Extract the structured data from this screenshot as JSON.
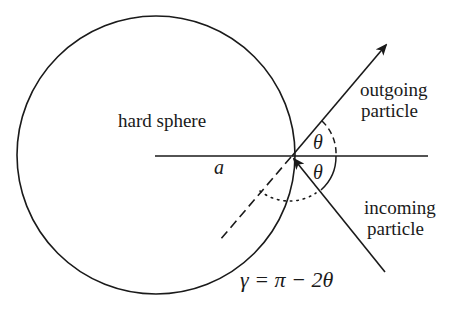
{
  "diagram": {
    "labels": {
      "sphere": "hard sphere",
      "radius": "a",
      "outgoing_line1": "outgoing",
      "outgoing_line2": "particle",
      "incoming_line1": "incoming",
      "incoming_line2": "particle",
      "theta_upper": "θ",
      "theta_lower": "θ",
      "equation": "γ = π − 2θ"
    },
    "geometry": {
      "sphere_center": [
        156,
        155
      ],
      "sphere_radius": 139,
      "contact_point": [
        292,
        156
      ],
      "horizontal_axis": {
        "x1": 155,
        "x2": 428,
        "y": 156
      },
      "incoming_ray": {
        "from": [
          385,
          272
        ],
        "to": [
          292,
          156
        ]
      },
      "outgoing_ray": {
        "from": [
          292,
          156
        ],
        "to": [
          386,
          45
        ]
      },
      "normal_dashed": {
        "from": [
          292,
          156
        ],
        "to": [
          220,
          240
        ]
      }
    },
    "colors": {
      "stroke": "#1a1a1a",
      "background": "#ffffff"
    }
  }
}
